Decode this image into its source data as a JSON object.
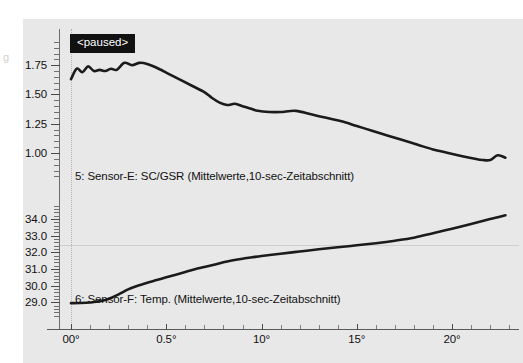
{
  "panel": {
    "background_color": "#e8e8e8",
    "page_background_color": "#ffffff",
    "edge_glyph": "g"
  },
  "status": {
    "paused_label": "<paused>",
    "badge_background": "#111111",
    "badge_text_color": "#ffffff"
  },
  "axes": {
    "y_upper_ticks": [
      "1.75",
      "1.50",
      "1.25",
      "1.00"
    ],
    "y_lower_ticks": [
      "34.0",
      "33.0",
      "32.0",
      "31.0",
      "30.0",
      "29.0"
    ],
    "x_ticks": [
      "00°",
      "0.5°",
      "10°",
      "15°",
      "20°"
    ]
  },
  "chart_data": {
    "type": "line",
    "title": "",
    "subtitle": "",
    "xlabel": "",
    "ylabel": "",
    "grid": "single horizontal gridline at 32.0 on lower axis; dotted vertical guide at x=0",
    "legend_position": "inline-inside-plot",
    "annotations": [
      {
        "text": "<paused>",
        "style": "black-box-white-text",
        "x": "00°",
        "y": "above 1.75"
      }
    ],
    "panels": [
      {
        "name": "upper",
        "series_label": "5: Sensor-E: SC/GSR (Mittelwerte,10-sec-Zeitabschnitt)",
        "series_name": "Sensor-E: SC/GSR",
        "channel": "5",
        "unit": "µS",
        "ylim": [
          0.88,
          1.82
        ],
        "yticks": [
          1.75,
          1.5,
          1.25,
          1.0
        ],
        "color": "#1b1b1b",
        "x": [
          0.0,
          0.3,
          0.6,
          0.9,
          1.2,
          1.5,
          1.8,
          2.1,
          2.4,
          2.8,
          3.2,
          3.6,
          4.0,
          4.6,
          5.2,
          5.8,
          6.4,
          7.0,
          7.4,
          7.8,
          8.2,
          8.6,
          9.0,
          9.4,
          9.8,
          10.4,
          11.0,
          11.8,
          12.6,
          13.4,
          14.2,
          15.0,
          15.8,
          16.6,
          17.4,
          18.2,
          19.0,
          19.8,
          20.6,
          21.2,
          21.6,
          22.0,
          22.4,
          22.8
        ],
        "y": [
          1.63,
          1.72,
          1.69,
          1.74,
          1.7,
          1.71,
          1.7,
          1.72,
          1.71,
          1.77,
          1.75,
          1.77,
          1.76,
          1.72,
          1.67,
          1.62,
          1.57,
          1.52,
          1.47,
          1.43,
          1.41,
          1.42,
          1.4,
          1.38,
          1.36,
          1.35,
          1.35,
          1.36,
          1.33,
          1.3,
          1.27,
          1.23,
          1.19,
          1.15,
          1.11,
          1.07,
          1.03,
          1.0,
          0.97,
          0.95,
          0.94,
          0.94,
          0.98,
          0.96
        ]
      },
      {
        "name": "lower",
        "series_label": "6: Sensor-F: Temp. (Mittelwerte,10-sec-Zeitabschnitt)",
        "series_name": "Sensor-F: Temp.",
        "channel": "6",
        "unit": "°C",
        "ylim": [
          28.6,
          34.6
        ],
        "yticks": [
          34.0,
          33.0,
          32.0,
          31.0,
          30.0,
          29.0
        ],
        "gridline": 32.0,
        "color": "#1b1b1b",
        "x": [
          0.0,
          0.5,
          1.0,
          1.5,
          2.0,
          2.5,
          3.0,
          3.5,
          4.0,
          4.5,
          5.0,
          5.5,
          6.0,
          6.5,
          7.0,
          7.5,
          8.0,
          8.5,
          9.0,
          9.5,
          10.0,
          11.0,
          12.0,
          13.0,
          14.0,
          15.0,
          16.0,
          17.0,
          18.0,
          19.0,
          20.0,
          21.0,
          22.0,
          22.8
        ],
        "y": [
          28.95,
          28.96,
          28.99,
          29.06,
          29.22,
          29.48,
          29.78,
          30.0,
          30.18,
          30.34,
          30.5,
          30.66,
          30.82,
          30.98,
          31.12,
          31.26,
          31.4,
          31.52,
          31.62,
          31.7,
          31.78,
          31.92,
          32.05,
          32.18,
          32.3,
          32.42,
          32.55,
          32.7,
          32.88,
          33.14,
          33.42,
          33.7,
          34.0,
          34.22
        ]
      }
    ]
  }
}
